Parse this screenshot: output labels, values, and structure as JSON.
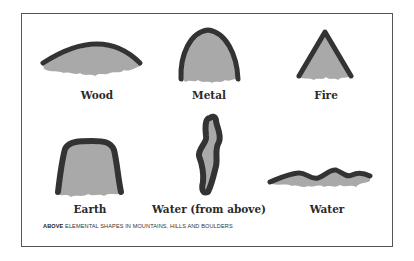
{
  "figure": {
    "colors": {
      "outline": "#333333",
      "fill": "#a9a9a9",
      "frame": "#555555"
    },
    "shapes": [
      {
        "id": "wood",
        "label": "Wood"
      },
      {
        "id": "metal",
        "label": "Metal"
      },
      {
        "id": "fire",
        "label": "Fire"
      },
      {
        "id": "earth",
        "label": "Earth"
      },
      {
        "id": "water-above",
        "label": "Water (from above)"
      },
      {
        "id": "water",
        "label": "Water"
      }
    ],
    "caption": {
      "lead": "ABOVE",
      "text": " ELEMENTAL SHAPES IN MOUNTAINS, HILLS AND BOULDERS"
    }
  }
}
